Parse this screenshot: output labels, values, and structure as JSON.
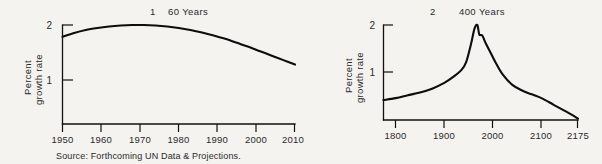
{
  "figure": {
    "source_note": "Source: Forthcoming UN Data & Projections.",
    "background_color": "#f4f3f0",
    "ink_color": "#0d0d0d"
  },
  "chart_data": [
    {
      "type": "line",
      "panel_number": "1",
      "title": "60 Years",
      "title_full": "1   60 Years",
      "xlabel": "",
      "ylabel": "Percent growth rate",
      "ylabel_line1": "Percent",
      "ylabel_line2": "growth rate",
      "xlim": [
        1950,
        2010
      ],
      "ylim": [
        0,
        2.2
      ],
      "xticks": [
        1950,
        1960,
        1970,
        1980,
        1990,
        2000,
        2010
      ],
      "xtick_labels": [
        "1950",
        "1960",
        "1970",
        "1980",
        "1990",
        "2000",
        "2010"
      ],
      "yticks": [
        1,
        2
      ],
      "ytick_labels": [
        "1",
        "2"
      ],
      "grid": false,
      "legend": "none",
      "series": [
        {
          "name": "World percent growth rate",
          "x": [
            1950,
            1953,
            1956,
            1959,
            1962,
            1965,
            1968,
            1971,
            1974,
            1977,
            1980,
            1983,
            1986,
            1989,
            1992,
            1995,
            1998,
            2001,
            2004,
            2007,
            2010
          ],
          "values": [
            1.76,
            1.84,
            1.9,
            1.94,
            1.97,
            1.99,
            2.0,
            2.0,
            1.99,
            1.97,
            1.94,
            1.9,
            1.85,
            1.79,
            1.72,
            1.64,
            1.56,
            1.47,
            1.38,
            1.29,
            1.2
          ]
        }
      ]
    },
    {
      "type": "line",
      "panel_number": "2",
      "title": "400 Years",
      "title_full": "2   400 Years",
      "xlabel": "",
      "ylabel": "Percent growth rate",
      "ylabel_line1": "Percent",
      "ylabel_line2": "growth rate",
      "xlim": [
        1775,
        2175
      ],
      "ylim": [
        0,
        2.2
      ],
      "xticks": [
        1800,
        1900,
        2000,
        2100,
        2175
      ],
      "xtick_labels": [
        "1800",
        "1900",
        "2000",
        "2100",
        "2175"
      ],
      "yticks": [
        1,
        2
      ],
      "ytick_labels": [
        "1",
        "2"
      ],
      "grid": false,
      "legend": "none",
      "series": [
        {
          "name": "World percent growth rate",
          "x": [
            1775,
            1800,
            1825,
            1850,
            1875,
            1900,
            1920,
            1935,
            1945,
            1955,
            1962,
            1968,
            1972,
            1978,
            1985,
            1995,
            2005,
            2020,
            2040,
            2060,
            2080,
            2100,
            2125,
            2150,
            2175
          ],
          "values": [
            0.42,
            0.46,
            0.52,
            0.58,
            0.66,
            0.78,
            0.92,
            1.05,
            1.22,
            1.6,
            1.92,
            2.0,
            1.8,
            1.78,
            1.62,
            1.42,
            1.22,
            0.96,
            0.74,
            0.62,
            0.54,
            0.46,
            0.32,
            0.18,
            0.03
          ]
        }
      ]
    }
  ]
}
